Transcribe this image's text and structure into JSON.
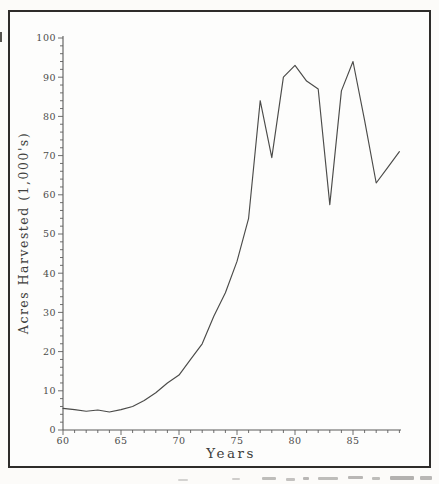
{
  "figure": {
    "background": "#fdfdfc",
    "border_color": "#2e2c2a",
    "axis_color": "#5a5a58",
    "label_color": "#4c4c4a"
  },
  "chart_data": {
    "type": "line",
    "title": "",
    "xlabel": "Years",
    "ylabel": "Acres Harvested (1,000's)",
    "x": [
      60,
      61,
      62,
      63,
      64,
      65,
      66,
      67,
      68,
      69,
      70,
      71,
      72,
      73,
      74,
      75,
      76,
      77,
      78,
      79,
      80,
      81,
      82,
      83,
      84,
      85,
      86,
      87,
      88,
      89
    ],
    "values": [
      5.5,
      5.2,
      4.8,
      5.1,
      4.6,
      5.2,
      6.0,
      7.5,
      9.5,
      12.0,
      14.0,
      18.0,
      22.0,
      29.0,
      35.0,
      43.0,
      54.0,
      84.0,
      69.5,
      90.0,
      93.0,
      89.0,
      87.0,
      57.5,
      86.5,
      94.0,
      79.0,
      63.0,
      67.0,
      71.0
    ],
    "xlim": [
      60,
      89
    ],
    "ylim": [
      0,
      100
    ],
    "x_major_ticks": [
      60,
      65,
      70,
      75,
      80,
      85
    ],
    "x_minor_step": 1,
    "y_major_ticks": [
      0,
      10,
      20,
      30,
      40,
      50,
      60,
      70,
      80,
      90,
      100
    ],
    "y_minor_step": 2,
    "grid": "off",
    "legend": "none",
    "line_color": "#4b4b49"
  }
}
